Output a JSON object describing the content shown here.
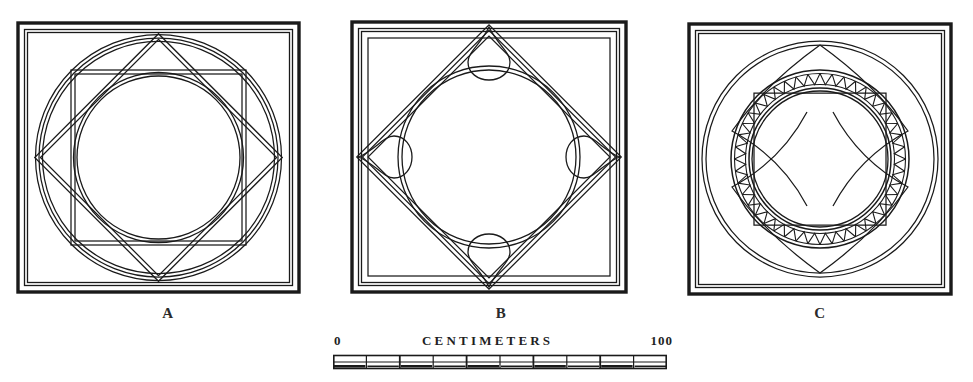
{
  "plate": {
    "title": "Geometric pavement panel drawings",
    "background_color": "#ffffff",
    "ink_color": "#1a1a1a"
  },
  "figures": [
    {
      "id": "A",
      "label": "A",
      "description": "Square frame enclosing a double circle, an eight-pointed star of two overlapping squares, and a double inner circle"
    },
    {
      "id": "B",
      "label": "B",
      "description": "Square frame with inscribed diamond band, central circle and four lobed bud motifs at the diamond points"
    },
    {
      "id": "C",
      "label": "C",
      "description": "Square frame enclosing a circle, a concave-sided octagram and a central ring of saw-tooth dentils"
    }
  ],
  "scale": {
    "zero_label": "0",
    "title": "CENTIMETERS",
    "max_label": "100",
    "units": "centimeters",
    "segments": 10,
    "segment_value": 10
  }
}
